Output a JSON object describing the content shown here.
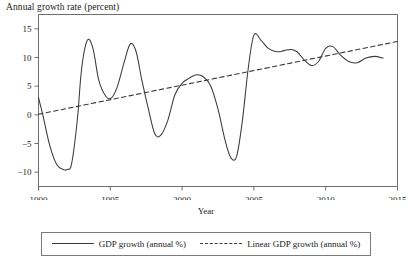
{
  "chart_data": {
    "type": "line",
    "title": "Annual growth rate (percent)",
    "xlabel": "Year",
    "ylabel": "",
    "xlim": [
      1990,
      2015
    ],
    "ylim": [
      -12.5,
      17.5
    ],
    "grid": false,
    "legend_position": "bottom",
    "xticks": [
      "1990",
      "1995",
      "2000",
      "2005",
      "2010",
      "2015"
    ],
    "xtick_values": [
      1990,
      1995,
      2000,
      2005,
      2010,
      2015
    ],
    "yticks": [
      "15",
      "10",
      "5",
      "0",
      "−5",
      "−10"
    ],
    "ytick_values": [
      15,
      10,
      5,
      0,
      -5,
      -10
    ],
    "series": [
      {
        "name": "GDP growth (annual %)",
        "style": "solid",
        "color": "#3a3a3a",
        "x": [
          1990.0,
          1990.3,
          1990.8,
          1991.3,
          1991.8,
          1992.0,
          1992.3,
          1992.7,
          1993.0,
          1993.4,
          1993.8,
          1994.2,
          1994.7,
          1995.1,
          1995.5,
          1996.0,
          1996.4,
          1996.8,
          1997.2,
          1997.7,
          1998.1,
          1998.5,
          1999.0,
          1999.5,
          2000.0,
          2000.5,
          2001.0,
          2001.5,
          2002.0,
          2002.5,
          2003.0,
          2003.4,
          2003.8,
          2004.2,
          2004.6,
          2005.0,
          2005.5,
          2006.0,
          2006.6,
          2007.1,
          2007.6,
          2008.0,
          2008.5,
          2009.0,
          2009.5,
          2010.0,
          2010.5,
          2011.0,
          2011.6,
          2012.2,
          2012.8,
          2013.4,
          2014.0
        ],
        "y": [
          3.0,
          0.0,
          -5.5,
          -8.8,
          -9.6,
          -9.5,
          -8.6,
          -1.0,
          8.0,
          13.0,
          11.5,
          6.0,
          3.2,
          3.0,
          5.0,
          9.5,
          12.4,
          11.0,
          6.0,
          0.5,
          -3.3,
          -3.6,
          -1.0,
          3.5,
          5.5,
          6.4,
          7.0,
          6.6,
          5.0,
          1.0,
          -4.5,
          -7.5,
          -7.2,
          -1.0,
          8.0,
          13.9,
          13.0,
          11.6,
          11.0,
          11.2,
          11.4,
          11.0,
          9.6,
          8.6,
          9.3,
          11.6,
          11.9,
          10.5,
          9.3,
          9.1,
          9.9,
          10.2,
          9.9
        ]
      },
      {
        "name": "Linear GDP growth (annual %)",
        "style": "dashed",
        "color": "#3a3a3a",
        "x": [
          1990,
          2015
        ],
        "y": [
          0.1,
          12.8
        ]
      }
    ]
  },
  "legend": {
    "entries": [
      {
        "label": "GDP growth (annual %)",
        "style": "solid"
      },
      {
        "label": "Linear GDP growth (annual %)",
        "style": "dashed"
      }
    ]
  }
}
